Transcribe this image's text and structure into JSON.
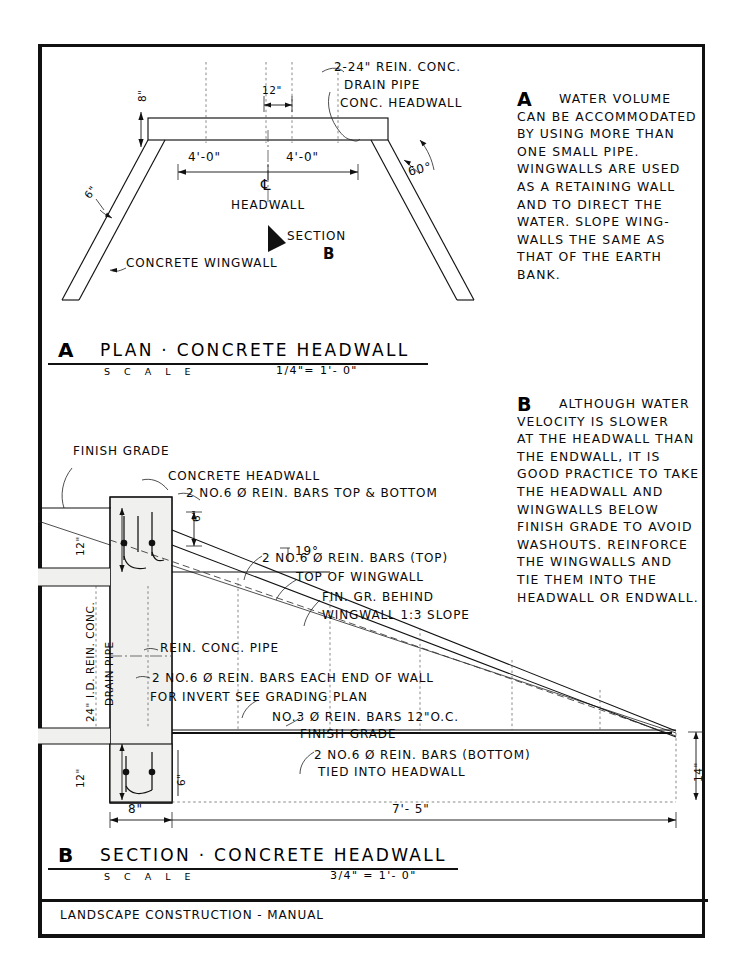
{
  "sheet": {
    "footer_title": "LANDSCAPE  CONSTRUCTION - MANUAL"
  },
  "plan_view": {
    "key_letter": "A",
    "title": "PLAN · CONCRETE  HEADWALL",
    "scale_word": "S C A L E",
    "scale_value": "1/4\"= 1'- 0\"",
    "labels": {
      "pipe_note_l1": "2-24\" REIN. CONC.",
      "pipe_note_l2": "DRAIN PIPE",
      "pipe_note_l3": "CONC. HEADWALL",
      "dim_12": "12\"",
      "dim_8": "8\"",
      "dim_left_4ft": "4'-0\"",
      "dim_right_4ft": "4'-0\"",
      "angle_60": "60°",
      "dim_6in": "6\"",
      "centerline_symbol": "℄",
      "headwall": "HEADWALL",
      "section_arrow": "SECTION",
      "section_letter": "B",
      "wingwall": "CONCRETE WINGWALL"
    }
  },
  "section_view": {
    "key_letter": "B",
    "title": "SECTION · CONCRETE  HEADWALL",
    "scale_word": "S C A L E",
    "scale_value": "3/4\" = 1'- 0\"",
    "labels": {
      "finish_grade_top": "FINISH GRADE",
      "concrete_headwall": "CONCRETE HEADWALL",
      "bars_top_bottom": "2 NO.6 Ø REIN. BARS TOP & BOTTOM",
      "dim_6in_head": "6\"",
      "angle_19": "19°",
      "bars_top": "2 NO.6 Ø REIN. BARS (TOP)",
      "top_of_wingwall": "TOP OF WINGWALL",
      "fin_gr_behind_l1": "FIN. GR. BEHIND",
      "fin_gr_behind_l2": "WINGWALL 1:3 SLOPE",
      "rein_conc_pipe": "REIN. CONC. PIPE",
      "bars_each_end": "2 NO.6 Ø REIN. BARS EACH END OF WALL",
      "invert_note": "FOR INVERT SEE GRADING PLAN",
      "bars_no3": "NO.3 Ø REIN. BARS 12\"O.C.",
      "finish_grade_low": "FINISH GRADE",
      "bars_bottom_l1": "2 NO.6 Ø REIN. BARS (BOTTOM)",
      "bars_bottom_l2": "TIED INTO HEADWALL",
      "dim_12_top": "12\"",
      "dim_12_bottom": "12\"",
      "pipe_label_l1": "24\" I.D. REIN. CONC.",
      "pipe_label_l2": "DRAIN PIPE",
      "dim_6in_wall": "6\"",
      "dim_8in_base": "8\"",
      "dim_7ft5": "7'- 5\"",
      "dim_14in": "14\""
    }
  },
  "notes": {
    "a": {
      "letter": "A",
      "lines": [
        "WATER VOLUME",
        "CAN BE ACCOMMODATED",
        "BY USING MORE THAN",
        "ONE  SMALL   PIPE.",
        "WINGWALLS ARE USED",
        "AS A RETAINING WALL",
        "AND TO DIRECT THE",
        "WATER. SLOPE WING-",
        "WALLS THE SAME AS",
        "THAT OF THE EARTH",
        "BANK."
      ]
    },
    "b": {
      "letter": "B",
      "lines": [
        "ALTHOUGH WATER",
        "VELOCITY IS SLOWER",
        "AT THE HEADWALL THAN",
        "THE ENDWALL, IT IS",
        "GOOD PRACTICE TO TAKE",
        "THE HEADWALL AND",
        "WINGWALLS BELOW",
        "FINISH GRADE TO AVOID",
        "WASHOUTS. REINFORCE",
        "THE WINGWALLS AND",
        "TIE THEM INTO THE",
        "HEADWALL OR ENDWALL."
      ]
    }
  },
  "colors": {
    "ink": "#111111",
    "paper": "#ffffff",
    "hatch": "#f0f0ee"
  }
}
